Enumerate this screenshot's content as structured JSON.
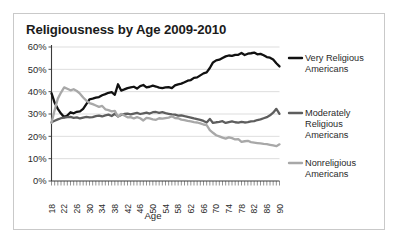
{
  "figure": {
    "border_color": "#c9c9c9",
    "background": "#ffffff"
  },
  "chart_data": {
    "type": "line",
    "title": "Religiousness by Age 2009-2010",
    "xlabel": "Age",
    "ylabel": "",
    "xlim": [
      18,
      90
    ],
    "ylim": [
      0,
      60
    ],
    "grid": true,
    "legend_position": "right",
    "ytick_labels": [
      "0%",
      "10%",
      "20%",
      "30%",
      "40%",
      "50%",
      "60%"
    ],
    "ytick_values": [
      0,
      10,
      20,
      30,
      40,
      50,
      60
    ],
    "xtick_labels": [
      "18",
      "22",
      "26",
      "30",
      "34",
      "38",
      "42",
      "46",
      "50",
      "54",
      "58",
      "62",
      "66",
      "70",
      "74",
      "78",
      "82",
      "86",
      "90"
    ],
    "xtick_values": [
      18,
      22,
      26,
      30,
      34,
      38,
      42,
      46,
      50,
      54,
      58,
      62,
      66,
      70,
      74,
      78,
      82,
      86,
      90
    ],
    "x": [
      18,
      19,
      20,
      21,
      22,
      23,
      24,
      25,
      26,
      27,
      28,
      29,
      30,
      31,
      32,
      33,
      34,
      35,
      36,
      37,
      38,
      39,
      40,
      41,
      42,
      43,
      44,
      45,
      46,
      47,
      48,
      49,
      50,
      51,
      52,
      53,
      54,
      55,
      56,
      57,
      58,
      59,
      60,
      61,
      62,
      63,
      64,
      65,
      66,
      67,
      68,
      69,
      70,
      71,
      72,
      73,
      74,
      75,
      76,
      77,
      78,
      79,
      80,
      81,
      82,
      83,
      84,
      85,
      86,
      87,
      88,
      89,
      90
    ],
    "series": [
      {
        "name": "Very Religious Americans",
        "color": "#111111",
        "width": 2.3,
        "values": [
          39.3,
          35.0,
          32.3,
          30.2,
          28.6,
          29.3,
          30.8,
          30.3,
          31.0,
          31.2,
          32.3,
          34.4,
          36.6,
          36.9,
          37.3,
          37.6,
          38.4,
          38.9,
          39.5,
          39.8,
          38.6,
          43.3,
          40.5,
          41.0,
          41.6,
          41.9,
          42.2,
          41.4,
          42.5,
          43.0,
          41.9,
          42.2,
          42.7,
          42.3,
          41.8,
          41.6,
          41.9,
          42.0,
          41.6,
          42.8,
          43.3,
          43.6,
          44.2,
          44.9,
          45.2,
          46.2,
          46.4,
          47.3,
          48.2,
          48.6,
          50.6,
          53.1,
          54.0,
          54.3,
          55.1,
          55.8,
          56.2,
          56.0,
          56.5,
          56.5,
          57.3,
          56.4,
          57.0,
          57.2,
          57.5,
          56.7,
          56.9,
          56.3,
          55.5,
          55.2,
          54.4,
          52.7,
          51.3
        ]
      },
      {
        "name": "Moderately Religious Americans",
        "color": "#5e5e5e",
        "width": 2.3,
        "values": [
          26.3,
          27.0,
          27.6,
          28.1,
          28.4,
          28.6,
          28.7,
          28.3,
          28.5,
          28.0,
          28.4,
          28.7,
          28.5,
          28.6,
          29.0,
          29.3,
          28.9,
          29.4,
          29.7,
          29.1,
          30.1,
          28.9,
          29.6,
          30.0,
          30.2,
          29.8,
          30.2,
          30.5,
          30.0,
          30.3,
          30.6,
          30.2,
          30.8,
          30.9,
          30.5,
          30.8,
          30.4,
          30.1,
          29.8,
          29.7,
          29.3,
          29.4,
          29.0,
          28.7,
          28.4,
          28.0,
          27.7,
          27.4,
          26.9,
          26.2,
          27.8,
          26.0,
          26.3,
          26.5,
          26.8,
          26.0,
          26.4,
          26.7,
          26.3,
          26.1,
          26.5,
          26.2,
          26.4,
          26.7,
          26.8,
          27.3,
          27.6,
          28.1,
          28.6,
          29.4,
          30.6,
          32.3,
          30.1
        ]
      },
      {
        "name": "Nonreligious Americans",
        "color": "#a8a8a8",
        "width": 2.3,
        "values": [
          26.0,
          31.8,
          36.9,
          39.6,
          41.9,
          41.3,
          40.6,
          41.1,
          40.3,
          39.1,
          37.4,
          36.0,
          34.9,
          34.4,
          33.8,
          33.2,
          33.6,
          32.1,
          31.7,
          31.2,
          31.4,
          28.8,
          30.0,
          29.3,
          28.5,
          28.6,
          28.0,
          28.6,
          28.1,
          27.1,
          28.3,
          28.0,
          27.6,
          27.4,
          28.1,
          27.9,
          28.2,
          28.4,
          29.0,
          28.2,
          28.1,
          27.5,
          27.3,
          26.9,
          26.7,
          26.4,
          26.2,
          25.8,
          25.3,
          25.0,
          22.8,
          21.6,
          20.5,
          20.0,
          19.4,
          19.0,
          19.5,
          19.2,
          18.6,
          18.7,
          17.5,
          17.8,
          18.0,
          17.4,
          17.2,
          17.0,
          16.8,
          16.6,
          16.5,
          16.2,
          15.9,
          15.6,
          16.4
        ]
      }
    ]
  },
  "legend": {
    "items": [
      {
        "label_line1": "Very Religious",
        "label_line2": "Americans",
        "label_line3": "",
        "color": "#111111"
      },
      {
        "label_line1": "Moderately",
        "label_line2": "Religious",
        "label_line3": "Americans",
        "color": "#5e5e5e"
      },
      {
        "label_line1": "Nonreligious",
        "label_line2": "Americans",
        "label_line3": "",
        "color": "#a8a8a8"
      }
    ]
  }
}
